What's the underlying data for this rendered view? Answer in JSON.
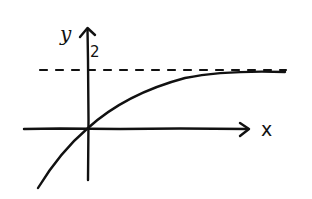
{
  "diagram": {
    "type": "hand-drawn function sketch",
    "axes": {
      "x_label": "x",
      "y_label": "y"
    },
    "asymptote": {
      "label": "2",
      "style": "dashed",
      "description": "horizontal asymptote y = 2"
    },
    "curve": {
      "description": "increasing concave-down curve through the origin approaching y = 2 from below"
    }
  }
}
